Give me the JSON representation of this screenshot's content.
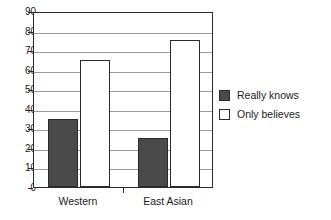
{
  "chart_data": {
    "type": "bar",
    "title": "",
    "xlabel": "",
    "ylabel": "",
    "categories": [
      "Western",
      "East Asian"
    ],
    "series": [
      {
        "name": "Really knows",
        "values": [
          35,
          25
        ],
        "color": "#4a4a4a"
      },
      {
        "name": "Only believes",
        "values": [
          65,
          75
        ],
        "color": "#ffffff"
      }
    ],
    "ylim": [
      0,
      90
    ],
    "ytick_step": 10,
    "ytick_labels": [
      "90",
      "80",
      "70",
      "60",
      "50",
      "40",
      "30",
      "20",
      "10",
      "0"
    ],
    "ytick_values": [
      90,
      80,
      70,
      60,
      50,
      40,
      30,
      20,
      10,
      0
    ],
    "grid": true,
    "legend_position": "right",
    "axis_color": "#2b2b2b",
    "grid_color": "#9a9a9a",
    "background": "#ffffff"
  }
}
